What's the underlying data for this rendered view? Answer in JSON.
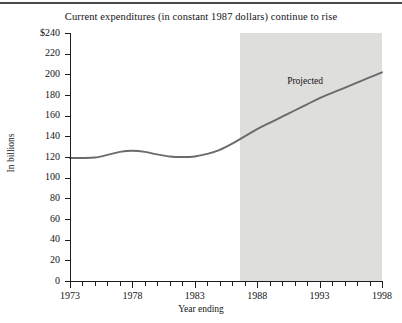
{
  "chart_data": {
    "type": "line",
    "title": "Current expenditures (in constant 1987 dollars) continue to rise",
    "xlabel": "Year ending",
    "ylabel": "In billions",
    "xlim": [
      1973,
      1998
    ],
    "ylim": [
      0,
      240
    ],
    "grid": false,
    "legend_position": "none",
    "y_tick_labels": [
      "$240",
      "220",
      "200",
      "180",
      "160",
      "140",
      "120",
      "100",
      "80",
      "60",
      "40",
      "20",
      "0"
    ],
    "y_tick_values": [
      240,
      220,
      200,
      180,
      160,
      140,
      120,
      100,
      80,
      60,
      40,
      20,
      0
    ],
    "x_tick_values": [
      1973,
      1974,
      1975,
      1976,
      1977,
      1978,
      1979,
      1980,
      1981,
      1982,
      1983,
      1984,
      1985,
      1986,
      1987,
      1988,
      1989,
      1990,
      1991,
      1992,
      1993,
      1994,
      1995,
      1996,
      1997,
      1998
    ],
    "x_major_labels": [
      "1973",
      "1978",
      "1983",
      "1988",
      "1993",
      "1998"
    ],
    "x_major_values": [
      1973,
      1978,
      1983,
      1988,
      1993,
      1998
    ],
    "x": [
      1973,
      1974,
      1975,
      1976,
      1977,
      1978,
      1979,
      1980,
      1981,
      1982,
      1983,
      1984,
      1985,
      1986,
      1987,
      1988,
      1989,
      1990,
      1991,
      1992,
      1993,
      1994,
      1995,
      1996,
      1997,
      1998
    ],
    "values": [
      119,
      119,
      119.5,
      122,
      125,
      126,
      125,
      122.5,
      120.5,
      120,
      120.5,
      123,
      127,
      133,
      140,
      147,
      153,
      159,
      165,
      171,
      177,
      182,
      187,
      192,
      197,
      202
    ],
    "series": [
      {
        "name": "Current expenditures",
        "color": "#6b6b6b",
        "values": [
          119,
          119,
          119.5,
          122,
          125,
          126,
          125,
          122.5,
          120.5,
          120,
          120.5,
          123,
          127,
          133,
          140,
          147,
          153,
          159,
          165,
          171,
          177,
          182,
          187,
          192,
          197,
          202
        ]
      }
    ],
    "annotations": [
      {
        "text": "Projected",
        "x": 1990.4,
        "y": 193
      }
    ],
    "shaded_region": {
      "label": "Projected",
      "x_start": 1986.6,
      "x_end": 1998,
      "color": "#dededd"
    },
    "colors": {
      "line": "#6b6b6b",
      "axis": "#1d1d1d",
      "text": "#141414",
      "shade": "#dededd",
      "top_rule": "#4a4a4a"
    }
  }
}
